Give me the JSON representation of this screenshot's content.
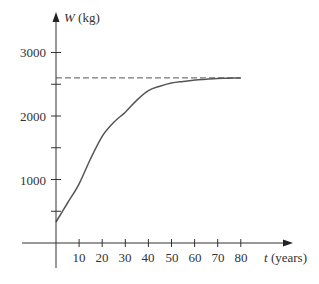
{
  "chart_data": {
    "type": "line",
    "title": "",
    "xlabel": "t (years)",
    "xlabel_var": "t",
    "xlabel_unit": "(years)",
    "ylabel": "W (kg)",
    "ylabel_var": "W",
    "ylabel_unit": "(kg)",
    "xlim": [
      0,
      100
    ],
    "ylim": [
      0,
      3600
    ],
    "x_ticks": [
      10,
      20,
      30,
      40,
      50,
      60,
      70,
      80
    ],
    "x_tick_labels": [
      "10",
      "20",
      "30",
      "40",
      "50",
      "60",
      "70",
      "80"
    ],
    "y_ticks": [
      500,
      1000,
      1500,
      2000,
      2500,
      3000
    ],
    "y_tick_labels": [
      "",
      "1000",
      "",
      "2000",
      "",
      "3000"
    ],
    "grid": false,
    "legend": null,
    "series": [
      {
        "name": "W(t)",
        "style": "solid",
        "x": [
          0,
          5,
          10,
          15,
          20,
          25,
          30,
          35,
          40,
          45,
          50,
          55,
          60,
          65,
          70,
          75,
          80
        ],
        "values": [
          330,
          630,
          930,
          1330,
          1680,
          1900,
          2060,
          2250,
          2400,
          2470,
          2520,
          2545,
          2565,
          2580,
          2590,
          2595,
          2600
        ]
      },
      {
        "name": "asymptote",
        "style": "dashed",
        "x": [
          0,
          80
        ],
        "values": [
          2600,
          2600
        ]
      }
    ],
    "annotations": []
  },
  "labels": {
    "y_tick_1000": "1000",
    "y_tick_2000": "2000",
    "y_tick_3000": "3000",
    "x_ticks": [
      "10",
      "20",
      "30",
      "40",
      "50",
      "60",
      "70",
      "80"
    ],
    "y_axis_var": "W",
    "y_axis_unit": " (kg)",
    "x_axis_var": "t",
    "x_axis_unit": " (years)"
  },
  "colors": {
    "axis": "#333333",
    "curve": "#555555",
    "dash": "#555555"
  }
}
